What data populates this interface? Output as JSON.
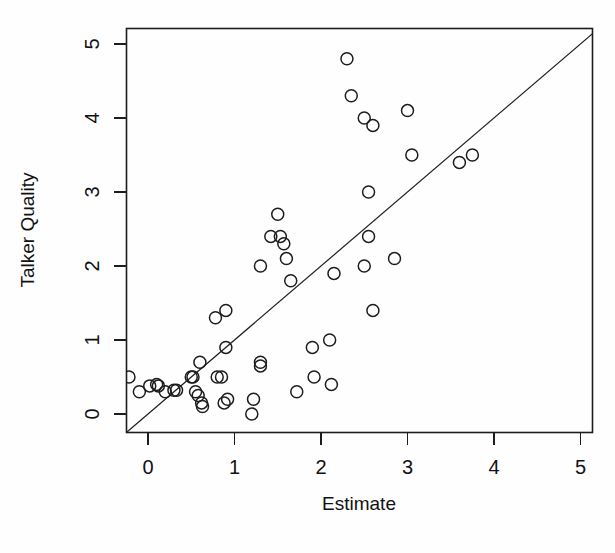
{
  "chart_data": {
    "type": "scatter",
    "title": "",
    "xlabel": "Estimate",
    "ylabel": "Talker Quality",
    "xlim": [
      -0.25,
      5.2
    ],
    "ylim": [
      -0.3,
      5.2
    ],
    "xticks": [
      0,
      1,
      2,
      3,
      4,
      5
    ],
    "yticks": [
      0,
      1,
      2,
      3,
      4,
      5
    ],
    "xtick_labels": [
      "0",
      "1",
      "2",
      "3",
      "4",
      "5"
    ],
    "ytick_labels": [
      "0",
      "1",
      "2",
      "3",
      "4",
      "5"
    ],
    "grid": false,
    "legend": null,
    "annotations": [],
    "reference_line": {
      "name": "identity-line",
      "type": "line",
      "equation": "y = x",
      "slope": 1,
      "intercept": 0,
      "x_start": -0.25,
      "y_start": -0.25,
      "x_end": 5.2,
      "y_end": 5.2
    },
    "marker": {
      "shape": "open-circle",
      "radius_px": 6,
      "fill": "none",
      "stroke": "#1d1d1d"
    },
    "series": [
      {
        "name": "talker-quality-vs-estimate",
        "points": [
          [
            -0.22,
            0.5
          ],
          [
            -0.1,
            0.3
          ],
          [
            0.02,
            0.38
          ],
          [
            0.1,
            0.4
          ],
          [
            0.12,
            0.38
          ],
          [
            0.2,
            0.3
          ],
          [
            0.3,
            0.32
          ],
          [
            0.33,
            0.32
          ],
          [
            0.5,
            0.5
          ],
          [
            0.52,
            0.5
          ],
          [
            0.55,
            0.3
          ],
          [
            0.58,
            0.25
          ],
          [
            0.6,
            0.7
          ],
          [
            0.62,
            0.15
          ],
          [
            0.63,
            0.1
          ],
          [
            0.78,
            1.3
          ],
          [
            0.8,
            0.5
          ],
          [
            0.85,
            0.5
          ],
          [
            0.88,
            0.15
          ],
          [
            0.9,
            1.4
          ],
          [
            0.9,
            0.9
          ],
          [
            0.92,
            0.2
          ],
          [
            1.2,
            0.0
          ],
          [
            1.22,
            0.2
          ],
          [
            1.3,
            2.0
          ],
          [
            1.3,
            0.7
          ],
          [
            1.3,
            0.65
          ],
          [
            1.42,
            2.4
          ],
          [
            1.5,
            2.7
          ],
          [
            1.53,
            2.4
          ],
          [
            1.57,
            2.3
          ],
          [
            1.6,
            2.1
          ],
          [
            1.65,
            1.8
          ],
          [
            1.72,
            0.3
          ],
          [
            1.9,
            0.9
          ],
          [
            1.92,
            0.5
          ],
          [
            2.1,
            1.0
          ],
          [
            2.12,
            0.4
          ],
          [
            2.15,
            1.9
          ],
          [
            2.3,
            4.8
          ],
          [
            2.35,
            4.3
          ],
          [
            2.5,
            4.0
          ],
          [
            2.5,
            2.0
          ],
          [
            2.55,
            3.0
          ],
          [
            2.55,
            2.4
          ],
          [
            2.6,
            3.9
          ],
          [
            2.6,
            1.4
          ],
          [
            2.85,
            2.1
          ],
          [
            3.0,
            4.1
          ],
          [
            3.05,
            3.5
          ],
          [
            3.6,
            3.4
          ],
          [
            3.75,
            3.5
          ]
        ]
      }
    ]
  },
  "figure": {
    "name": "scatter-plot",
    "background": "#fefefe",
    "foreground": "#1d1d1d"
  }
}
